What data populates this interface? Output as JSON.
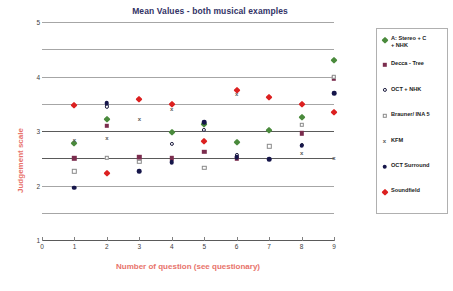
{
  "chart_data": {
    "type": "scatter",
    "title": "Mean Values - both musical examples",
    "xlabel": "Number of question (see questionary)",
    "ylabel": "Judgement scale",
    "xlim": [
      0,
      9
    ],
    "ylim": [
      1,
      5
    ],
    "xticks": [
      "0",
      "1",
      "2",
      "3",
      "4",
      "5",
      "6",
      "7",
      "8",
      "9"
    ],
    "yticks": [
      "1",
      "2",
      "3",
      "4",
      "5"
    ],
    "gridlines_y": [
      1.5,
      2,
      2.5,
      3,
      3.5,
      4,
      4.5,
      5
    ],
    "grid": true,
    "legend_position": "right",
    "categories": [
      1,
      2,
      3,
      4,
      5,
      6,
      7,
      8,
      9
    ],
    "series": [
      {
        "name": "A: Stereo + C\n+ NHK",
        "marker": "diamond",
        "color": "#4a8a3c",
        "values": [
          2.78,
          3.22,
          null,
          2.99,
          3.12,
          2.79,
          3.02,
          3.25,
          4.3
        ]
      },
      {
        "name": "Decca - Tree",
        "marker": "square",
        "color": "#7b2d4e",
        "values": [
          2.5,
          3.09,
          2.52,
          2.5,
          2.62,
          2.5,
          null,
          2.96,
          3.97
        ]
      },
      {
        "name": "OCT + NHK",
        "marker": "circle-open",
        "color": "#1a1a3c",
        "values": [
          null,
          3.45,
          null,
          2.76,
          3.02,
          2.56,
          null,
          2.74,
          3.99
        ]
      },
      {
        "name": "Brauner/ INA 5",
        "marker": "square-open",
        "color": "#8a8a8a",
        "values": [
          2.26,
          2.51,
          2.44,
          null,
          2.33,
          null,
          2.72,
          3.11,
          4.0
        ]
      },
      {
        "name": "KFM",
        "marker": "x",
        "color": "#595959",
        "values": [
          2.84,
          2.88,
          3.22,
          3.41,
          3.16,
          3.68,
          null,
          2.6,
          2.5
        ]
      },
      {
        "name": "OCT Surround",
        "marker": "circle",
        "color": "#16164a",
        "values": [
          1.96,
          3.51,
          2.26,
          2.43,
          3.16,
          2.52,
          2.48,
          2.73,
          3.69
        ]
      },
      {
        "name": "Soundfield",
        "marker": "diamond",
        "color": "#dc2020",
        "values": [
          3.48,
          2.23,
          3.58,
          3.49,
          2.81,
          3.76,
          3.62,
          3.49,
          3.35
        ]
      }
    ]
  },
  "legend": {
    "items": [
      {
        "label": "A: Stereo + C\n+ NHK",
        "marker": "diamond",
        "color": "#4a8a3c"
      },
      {
        "label": "Decca - Tree",
        "marker": "square",
        "color": "#7b2d4e"
      },
      {
        "label": "OCT + NHK",
        "marker": "circle-open",
        "color": "#1a1a3c"
      },
      {
        "label": "Brauner/ INA 5",
        "marker": "square-open",
        "color": "#8a8a8a"
      },
      {
        "label": "KFM",
        "marker": "x",
        "color": "#595959"
      },
      {
        "label": "OCT Surround",
        "marker": "circle",
        "color": "#16164a"
      },
      {
        "label": "Soundfield",
        "marker": "diamond",
        "color": "#dc2020"
      }
    ]
  },
  "colors": {
    "title": "#333366",
    "axis_title": "#e8736b",
    "grid": "#a6a6a6",
    "grid_major": "#5a5a5a",
    "tick_text": "#404040"
  }
}
